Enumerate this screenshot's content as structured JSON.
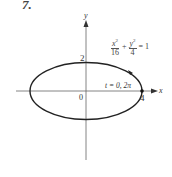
{
  "problem_number": "7.",
  "axes": {
    "x_label": "x",
    "y_label": "y",
    "origin_label": "0"
  },
  "tick_labels": {
    "y_top": "2",
    "x_right": "4"
  },
  "equation": {
    "term1_num": "x",
    "term1_num_exp": "2",
    "term1_den": "16",
    "plus": "+",
    "term2_num": "y",
    "term2_num_exp": "2",
    "term2_den": "4",
    "rhs": "= 1"
  },
  "param_label": "t = 0, 2π",
  "colors": {
    "curve": "#222222",
    "axis": "#555555"
  }
}
